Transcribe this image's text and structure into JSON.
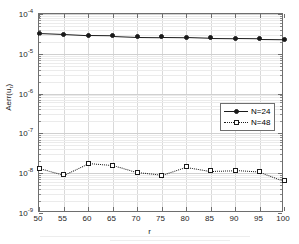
{
  "figure": {
    "background": "#ffffff",
    "axes_color": "#6e6e6e",
    "grid_color": "#d9d9d9",
    "series_color": "#1a1a1a"
  },
  "axis": {
    "xlabel": "r",
    "ylabel_main": "Aerr(u",
    "ylabel_sub": "r",
    "ylabel_tail": ")",
    "x_ticks": [
      "50",
      "55",
      "60",
      "65",
      "70",
      "75",
      "80",
      "85",
      "90",
      "95",
      "100"
    ],
    "y_ticks": [
      {
        "mantissa": "10",
        "exponent": "-4"
      },
      {
        "mantissa": "10",
        "exponent": "-5"
      },
      {
        "mantissa": "10",
        "exponent": "-6"
      },
      {
        "mantissa": "10",
        "exponent": "-7"
      },
      {
        "mantissa": "10",
        "exponent": "-8"
      },
      {
        "mantissa": "10",
        "exponent": "-9"
      }
    ]
  },
  "legend": {
    "position": "center-right",
    "entries": [
      {
        "label": "N=24",
        "line_style": "solid",
        "marker": "filled-circle"
      },
      {
        "label": "N=48",
        "line_style": "dotted",
        "marker": "open-square"
      }
    ]
  },
  "chart_data": {
    "type": "line",
    "title": "",
    "xlabel": "r",
    "ylabel": "Aerr(u_r)",
    "yscale": "log",
    "xscale": "linear",
    "xlim": [
      50,
      100
    ],
    "ylim": [
      1e-09,
      0.0001
    ],
    "grid": true,
    "legend_position": "center-right",
    "x": [
      50,
      55,
      60,
      65,
      70,
      75,
      80,
      85,
      90,
      95,
      100
    ],
    "series": [
      {
        "name": "N=24",
        "line_style": "solid",
        "marker": "filled-circle",
        "values": [
          3.3e-05,
          3.1e-05,
          2.9e-05,
          2.85e-05,
          2.7e-05,
          2.65e-05,
          2.6e-05,
          2.5e-05,
          2.45e-05,
          2.4e-05,
          2.35e-05
        ]
      },
      {
        "name": "N=48",
        "line_style": "dotted",
        "marker": "open-square",
        "values": [
          1.35e-08,
          9.2e-09,
          1.8e-08,
          1.6e-08,
          1.05e-08,
          9e-09,
          1.45e-08,
          1.15e-08,
          1.2e-08,
          1.1e-08,
          6.5e-09
        ]
      }
    ]
  }
}
